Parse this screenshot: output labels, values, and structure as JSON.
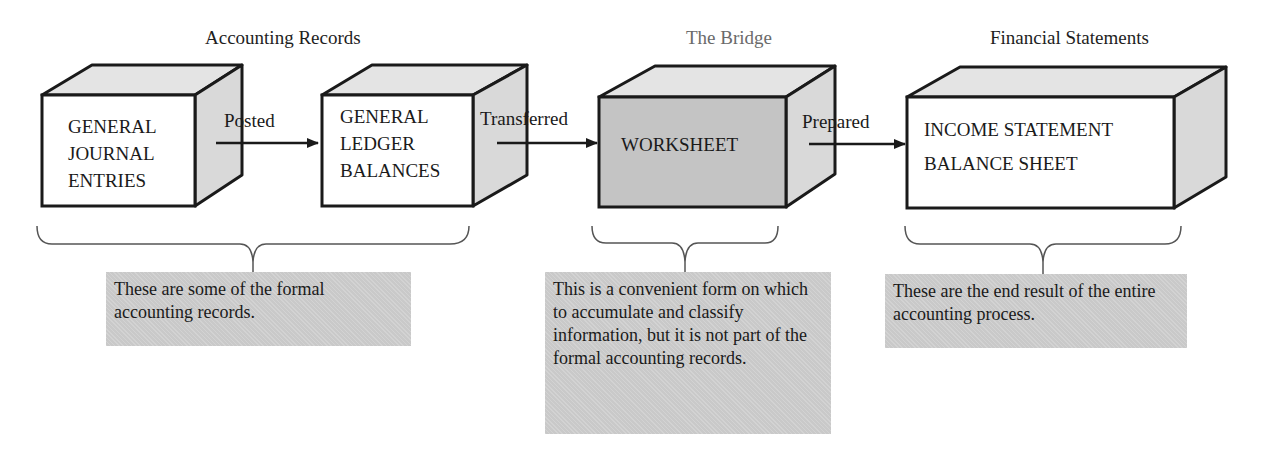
{
  "sections": [
    {
      "title": "Accounting Records"
    },
    {
      "title": "The Bridge"
    },
    {
      "title": "Financial Statements"
    }
  ],
  "boxes": [
    {
      "lines": [
        "GENERAL",
        "JOURNAL",
        "ENTRIES"
      ],
      "fill": "#ffffff"
    },
    {
      "lines": [
        "GENERAL",
        "LEDGER",
        "BALANCES"
      ],
      "fill": "#ffffff"
    },
    {
      "lines": [
        "WORKSHEET"
      ],
      "fill": "#c4c4c4"
    },
    {
      "lines": [
        "INCOME STATEMENT",
        "BALANCE SHEET"
      ],
      "fill": "#ffffff"
    }
  ],
  "arrows": [
    {
      "label": "Posted"
    },
    {
      "label": "Transferred"
    },
    {
      "label": "Prepared"
    }
  ],
  "notes": [
    {
      "text": "These are some of the formal accounting records."
    },
    {
      "text": "This is a convenient form on which to accumulate and classify information, but it is not part of the formal accounting records."
    },
    {
      "text": "These are the end result of the entire accounting process."
    }
  ],
  "colors": {
    "side_shade": "#d9d9d9",
    "top_shade": "#e4e4e4",
    "note_fill": "#c9c9c9",
    "stroke": "#1a1a1a",
    "brace": "#555555"
  }
}
